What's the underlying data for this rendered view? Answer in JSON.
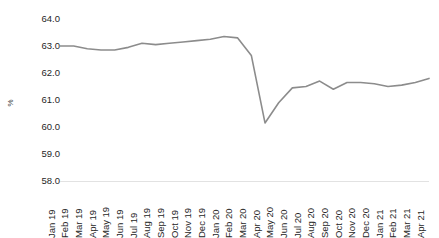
{
  "chart_data": {
    "type": "line",
    "title": "",
    "subtitle": "",
    "xlabel": "",
    "ylabel": "%",
    "ylim": [
      58.0,
      64.0
    ],
    "ytick_step": 1.0,
    "yticks": [
      "64.0",
      "63.0",
      "62.0",
      "61.0",
      "60.0",
      "59.0",
      "58.0"
    ],
    "grid": false,
    "legend": "none",
    "line_color": "#8c8c8c",
    "axis_color": "#e2e2e2",
    "text_color": "#262626",
    "categories": [
      "Jan 19",
      "Feb 19",
      "Mar 19",
      "Apr 19",
      "May 19",
      "Jun 19",
      "Jul 19",
      "Aug 19",
      "Sep 19",
      "Oct 19",
      "Nov 19",
      "Dec 19",
      "Jan 20",
      "Feb 20",
      "Mar 20",
      "Apr 20",
      "May 20",
      "Jun 20",
      "Jul 20",
      "Aug 20",
      "Sep 20",
      "Oct 20",
      "Nov 20",
      "Dec 20",
      "Jan 21",
      "Feb 21",
      "Mar 21",
      "Apr 21"
    ],
    "series": [
      {
        "name": "Employment-population ratio",
        "values": [
          63.0,
          63.0,
          62.9,
          62.85,
          62.85,
          62.95,
          63.1,
          63.05,
          63.1,
          63.15,
          63.2,
          63.25,
          63.35,
          63.3,
          62.65,
          60.15,
          60.9,
          61.45,
          61.5,
          61.7,
          61.4,
          61.65,
          61.65,
          61.6,
          61.5,
          61.55,
          61.65,
          61.8
        ]
      }
    ]
  }
}
